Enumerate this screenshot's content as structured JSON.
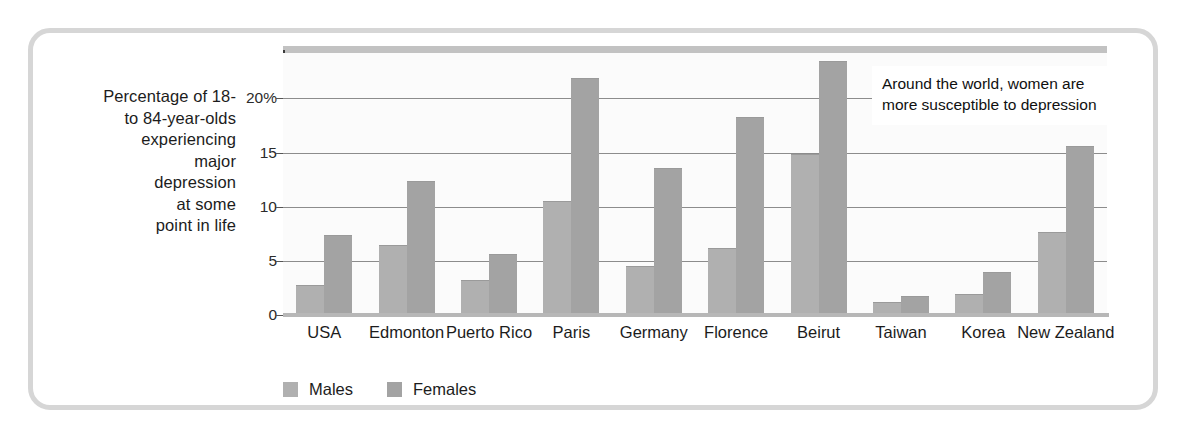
{
  "chart_data": {
    "type": "bar",
    "title": "",
    "xlabel": "",
    "ylabel": "Percentage of 18- to 84-year-olds experiencing major depression at some point in life",
    "ylim": [
      0,
      24.2
    ],
    "yticks": [
      0,
      5,
      10,
      15,
      20
    ],
    "ytick_labels": [
      "0",
      "5",
      "10",
      "15",
      "20%"
    ],
    "grid": true,
    "legend_position": "bottom-left",
    "categories": [
      "USA",
      "Edmonton",
      "Puerto Rico",
      "Paris",
      "Germany",
      "Florence",
      "Beirut",
      "Taiwan",
      "Korea",
      "New Zealand"
    ],
    "series": [
      {
        "name": "Males",
        "color": "#b0b0b0",
        "values": [
          2.8,
          6.5,
          3.2,
          10.5,
          4.5,
          6.2,
          14.9,
          1.2,
          1.9,
          7.7
        ]
      },
      {
        "name": "Females",
        "color": "#a3a3a3",
        "values": [
          7.4,
          12.4,
          5.6,
          21.9,
          13.6,
          18.3,
          23.5,
          1.8,
          4.0,
          15.6
        ]
      }
    ],
    "annotations": [
      {
        "text": "Around the world, women are more susceptible to depression"
      }
    ]
  },
  "ylabel_lines": [
    "Percentage of 18-",
    "to 84-year-olds",
    "experiencing",
    "major",
    "depression",
    "at some",
    "point in life"
  ],
  "annotation": {
    "text": "Around the world, women are more susceptible to depression"
  },
  "colors": {
    "males": "#b0b0b0",
    "females": "#a3a3a3",
    "gridline": "#8c8c8c",
    "frame": "#d6d6d6",
    "axis": "#3a3a3a",
    "text": "#1c1c1c"
  }
}
